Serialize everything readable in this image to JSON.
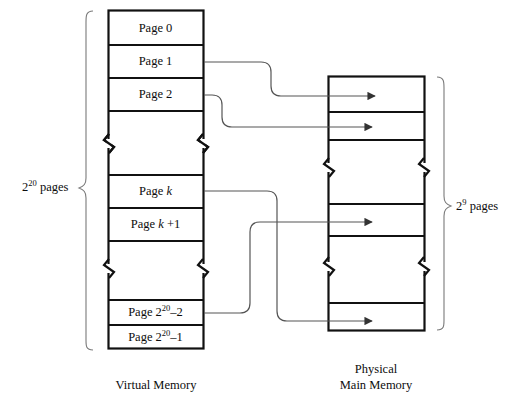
{
  "figure": {
    "background_color": "#ffffff",
    "stroke_color": "#111111",
    "connector_color": "#555555"
  },
  "virtual_memory": {
    "caption": "Virtual Memory",
    "bracket_label_base": "2",
    "bracket_label_exp": "20",
    "bracket_label_suffix": " pages",
    "cells": [
      {
        "id": "page-0",
        "text": "Page 0",
        "kind": "page"
      },
      {
        "id": "page-1",
        "text": "Page 1",
        "kind": "page"
      },
      {
        "id": "page-2",
        "text": "Page 2",
        "kind": "page"
      },
      {
        "id": "gap-upper",
        "text": "",
        "kind": "break"
      },
      {
        "id": "page-k",
        "text": "Page k",
        "kind": "page"
      },
      {
        "id": "page-k-plus-1",
        "text": "Page k +1",
        "kind": "page"
      },
      {
        "id": "gap-lower",
        "text": "",
        "kind": "break"
      },
      {
        "id": "page-2e20-m2",
        "text": "Page 2^20 –2",
        "kind": "page"
      },
      {
        "id": "page-2e20-m1",
        "text": "Page 2^20 –1",
        "kind": "page"
      }
    ]
  },
  "physical_memory": {
    "caption_line1": "Physical",
    "caption_line2": "Main Memory",
    "bracket_label_base": "2",
    "bracket_label_exp": "9",
    "bracket_label_suffix": " pages",
    "frames": [
      {
        "id": "frame-0",
        "kind": "frame"
      },
      {
        "id": "frame-1",
        "kind": "frame"
      },
      {
        "id": "frame-2",
        "kind": "frame"
      },
      {
        "id": "gap-upper",
        "kind": "break"
      },
      {
        "id": "frame-3",
        "kind": "frame"
      },
      {
        "id": "frame-4",
        "kind": "frame"
      },
      {
        "id": "gap-lower",
        "kind": "break"
      },
      {
        "id": "frame-5",
        "kind": "frame"
      }
    ]
  },
  "mappings": [
    {
      "id": "map-page-1",
      "from": "Page 1",
      "to": "frame-0"
    },
    {
      "id": "map-page-2",
      "from": "Page 2",
      "to": "frame-1"
    },
    {
      "id": "map-page-k",
      "from": "Page k",
      "to": "frame-3"
    },
    {
      "id": "map-page-2e20-m2",
      "from": "Page 2^20 –2",
      "to": "frame-5"
    }
  ]
}
